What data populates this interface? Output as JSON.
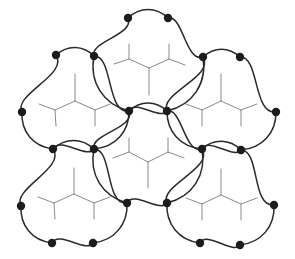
{
  "diagram": {
    "width": 295,
    "height": 259,
    "background": "#ffffff",
    "outline_color": "#2a2a2a",
    "skeleton_color": "#8a8a8a",
    "vertex_color": "#1c1c1c",
    "vertex_radius": 4.2,
    "cells": [
      {
        "name": "top",
        "vertices": [
          [
            128,
            18
          ],
          [
            168,
            18
          ],
          [
            203,
            57
          ],
          [
            167,
            111
          ],
          [
            129,
            111
          ],
          [
            94,
            56
          ]
        ],
        "edge_bulge": "out",
        "skeleton": {
          "center": [
            149,
            68
          ],
          "stem": [
            149,
            95
          ],
          "left": [
            129,
            59
          ],
          "left_a": [
            129,
            44
          ],
          "left_b": [
            114,
            64
          ],
          "right": [
            169,
            59
          ],
          "right_a": [
            169,
            44
          ],
          "right_b": [
            185,
            65
          ]
        }
      },
      {
        "name": "left",
        "vertices": [
          [
            56,
            55
          ],
          [
            94,
            56
          ],
          [
            129,
            111
          ],
          [
            94,
            149
          ],
          [
            53,
            149
          ],
          [
            22,
            112
          ]
        ],
        "edge_bulge": "out",
        "skeleton": {
          "center": [
            75,
            101
          ],
          "stem": [
            75,
            74
          ],
          "left": [
            55,
            110
          ],
          "left_a": [
            56,
            126
          ],
          "left_b": [
            39,
            104
          ],
          "right": [
            95,
            110
          ],
          "right_a": [
            95,
            126
          ],
          "right_b": [
            110,
            104
          ]
        }
      },
      {
        "name": "right",
        "vertices": [
          [
            203,
            57
          ],
          [
            240,
            57
          ],
          [
            276,
            112
          ],
          [
            241,
            150
          ],
          [
            202,
            149
          ],
          [
            167,
            111
          ]
        ],
        "edge_bulge": "out",
        "skeleton": {
          "center": [
            221,
            101
          ],
          "stem": [
            221,
            74
          ],
          "left": [
            202,
            110
          ],
          "left_a": [
            202,
            126
          ],
          "left_b": [
            186,
            104
          ],
          "right": [
            241,
            110
          ],
          "right_a": [
            241,
            126
          ],
          "right_b": [
            257,
            104
          ]
        }
      },
      {
        "name": "center",
        "vertices": [
          [
            129,
            111
          ],
          [
            167,
            111
          ],
          [
            202,
            149
          ],
          [
            167,
            203
          ],
          [
            127,
            203
          ],
          [
            94,
            149
          ]
        ],
        "edge_bulge": "out",
        "skeleton": {
          "center": [
            148,
            162
          ],
          "stem": [
            148,
            188
          ],
          "left": [
            129,
            152
          ],
          "left_a": [
            129,
            138
          ],
          "left_b": [
            113,
            158
          ],
          "right": [
            168,
            152
          ],
          "right_a": [
            168,
            138
          ],
          "right_b": [
            184,
            158
          ]
        }
      },
      {
        "name": "bottom-left",
        "vertices": [
          [
            53,
            149
          ],
          [
            94,
            149
          ],
          [
            127,
            203
          ],
          [
            93,
            243
          ],
          [
            52,
            243
          ],
          [
            21,
            206
          ]
        ],
        "edge_bulge": "out",
        "skeleton": {
          "center": [
            74,
            194
          ],
          "stem": [
            74,
            168
          ],
          "left": [
            54,
            203
          ],
          "left_a": [
            55,
            219
          ],
          "left_b": [
            38,
            197
          ],
          "right": [
            94,
            203
          ],
          "right_a": [
            94,
            219
          ],
          "right_b": [
            110,
            197
          ]
        }
      },
      {
        "name": "bottom-right",
        "vertices": [
          [
            202,
            149
          ],
          [
            241,
            150
          ],
          [
            274,
            205
          ],
          [
            240,
            245
          ],
          [
            200,
            243
          ],
          [
            167,
            203
          ]
        ],
        "edge_bulge": "out",
        "skeleton": {
          "center": [
            221,
            195
          ],
          "stem": [
            221,
            169
          ],
          "left": [
            202,
            204
          ],
          "left_a": [
            202,
            220
          ],
          "left_b": [
            186,
            198
          ],
          "right": [
            241,
            204
          ],
          "right_a": [
            241,
            220
          ],
          "right_b": [
            257,
            198
          ]
        }
      }
    ]
  }
}
